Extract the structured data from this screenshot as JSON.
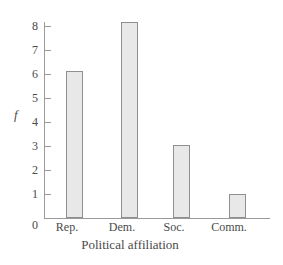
{
  "chart_data": {
    "type": "bar",
    "title": "",
    "categories": [
      "Rep.",
      "Dem.",
      "Soc.",
      "Comm."
    ],
    "values": [
      6,
      8,
      3,
      1
    ],
    "series": [
      {
        "name": "f",
        "values": [
          6,
          8,
          3,
          1
        ]
      }
    ],
    "xlabel": "Political affiliation",
    "ylabel": "f",
    "ylim": [
      0,
      8
    ],
    "ytick_labels": [
      "8",
      "7",
      "6",
      "5",
      "4",
      "3",
      "2",
      "1"
    ],
    "ytick_values": [
      8,
      7,
      6,
      5,
      4,
      3,
      2,
      1
    ],
    "origin_label": "0",
    "grid": false,
    "legend": false,
    "colors": {
      "bar_fill": "#e8e8e8",
      "bar_border": "#8f8f8f",
      "axis": "#9a9a9a",
      "text": "#4a4a4a",
      "background": "#ffffff"
    }
  }
}
